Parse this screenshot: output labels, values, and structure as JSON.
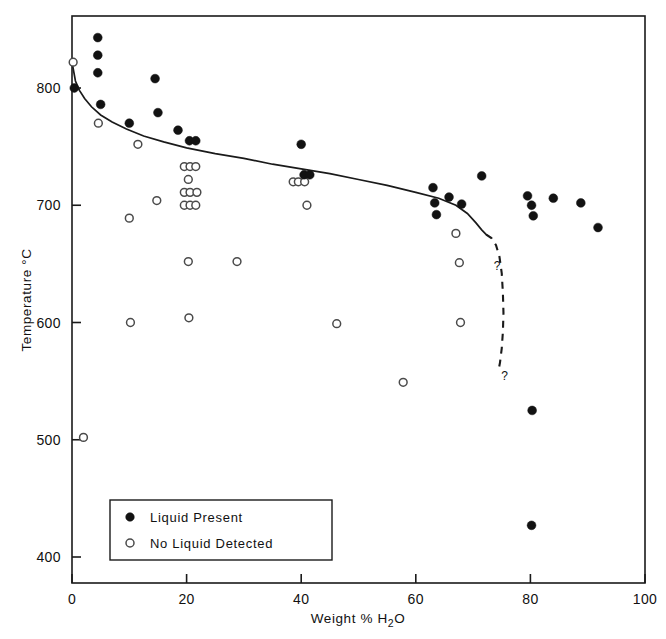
{
  "chart_data": {
    "type": "scatter",
    "title": "",
    "xlabel": "Weight % H2O",
    "xlabel_parts": {
      "pre": "Weight %  H",
      "sub": "2",
      "post": "O"
    },
    "ylabel": "Temperature °C",
    "xlim": [
      0,
      100
    ],
    "ylim": [
      380,
      860
    ],
    "xticks": [
      0,
      20,
      40,
      60,
      80,
      100
    ],
    "xtick_labels": [
      "0",
      "20",
      "40",
      "60",
      "80",
      "100"
    ],
    "yticks": [
      400,
      500,
      600,
      700,
      800
    ],
    "ytick_labels": [
      "400",
      "500",
      "600",
      "700",
      "800"
    ],
    "grid": false,
    "legend_position": "lower-left-inside",
    "series": [
      {
        "name": "Liquid Present",
        "marker": "filled-circle",
        "color": "#121212",
        "points": [
          [
            0.4,
            800
          ],
          [
            4.5,
            843
          ],
          [
            4.5,
            828
          ],
          [
            4.5,
            813
          ],
          [
            5.0,
            786
          ],
          [
            10.0,
            770
          ],
          [
            14.5,
            808
          ],
          [
            15.0,
            779
          ],
          [
            18.5,
            764
          ],
          [
            20.5,
            755
          ],
          [
            21.6,
            755
          ],
          [
            40.0,
            752
          ],
          [
            40.5,
            726
          ],
          [
            41.5,
            726
          ],
          [
            63.0,
            715
          ],
          [
            63.3,
            702
          ],
          [
            63.6,
            692
          ],
          [
            65.8,
            707
          ],
          [
            68.0,
            701
          ],
          [
            71.5,
            725
          ],
          [
            79.5,
            708
          ],
          [
            80.2,
            700
          ],
          [
            80.5,
            691
          ],
          [
            84.0,
            706
          ],
          [
            88.8,
            702
          ],
          [
            91.8,
            681
          ],
          [
            80.3,
            525
          ],
          [
            80.2,
            427
          ]
        ]
      },
      {
        "name": "No Liquid Detected",
        "marker": "open-circle",
        "color": "#ffffff",
        "points": [
          [
            0.2,
            822
          ],
          [
            2.0,
            502
          ],
          [
            4.6,
            770
          ],
          [
            10.0,
            689
          ],
          [
            10.2,
            600
          ],
          [
            11.5,
            752
          ],
          [
            14.8,
            704
          ],
          [
            19.6,
            733
          ],
          [
            20.6,
            733
          ],
          [
            21.6,
            733
          ],
          [
            20.3,
            722
          ],
          [
            19.6,
            711
          ],
          [
            20.6,
            711
          ],
          [
            21.8,
            711
          ],
          [
            19.6,
            700
          ],
          [
            20.6,
            700
          ],
          [
            21.6,
            700
          ],
          [
            20.3,
            652
          ],
          [
            20.4,
            604
          ],
          [
            28.8,
            652
          ],
          [
            38.6,
            720
          ],
          [
            39.5,
            720
          ],
          [
            40.6,
            720
          ],
          [
            41.0,
            700
          ],
          [
            46.2,
            599
          ],
          [
            57.8,
            549
          ],
          [
            67.0,
            676
          ],
          [
            67.6,
            651
          ],
          [
            67.8,
            600
          ]
        ]
      }
    ],
    "curves": [
      {
        "name": "liquidus-solid",
        "style": "solid",
        "annotation": "",
        "points": [
          [
            0.0,
            822
          ],
          [
            0.6,
            806
          ],
          [
            1.3,
            798
          ],
          [
            2.2,
            791
          ],
          [
            3.4,
            784
          ],
          [
            5.0,
            777
          ],
          [
            7.0,
            771
          ],
          [
            9.5,
            765
          ],
          [
            12.5,
            759
          ],
          [
            16.0,
            754
          ],
          [
            20.0,
            749
          ],
          [
            25.0,
            744
          ],
          [
            30.0,
            740
          ],
          [
            35.0,
            735
          ],
          [
            40.0,
            731
          ],
          [
            45.0,
            727
          ],
          [
            50.0,
            722
          ],
          [
            55.0,
            717
          ],
          [
            60.0,
            711
          ],
          [
            64.0,
            706
          ],
          [
            67.0,
            700
          ],
          [
            69.0,
            693
          ],
          [
            70.5,
            685
          ],
          [
            71.5,
            679
          ],
          [
            72.3,
            675
          ]
        ]
      },
      {
        "name": "liquidus-dashed-extrapolation",
        "style": "dashed",
        "annotation": "?",
        "points": [
          [
            72.3,
            675
          ],
          [
            73.2,
            672
          ],
          [
            74.0,
            666
          ],
          [
            74.6,
            656
          ],
          [
            75.0,
            642
          ],
          [
            75.2,
            625
          ],
          [
            75.3,
            608
          ],
          [
            75.2,
            592
          ],
          [
            75.0,
            578
          ],
          [
            74.7,
            566
          ],
          [
            74.4,
            558
          ]
        ]
      }
    ],
    "annotations": [
      {
        "text": "?",
        "x": 73.6,
        "y": 645
      },
      {
        "text": "?",
        "x": 74.9,
        "y": 551
      }
    ]
  },
  "legend": {
    "items": [
      {
        "marker": "filled-circle",
        "label": "Liquid  Present"
      },
      {
        "marker": "open-circle",
        "label": "No Liquid Detected"
      }
    ]
  }
}
